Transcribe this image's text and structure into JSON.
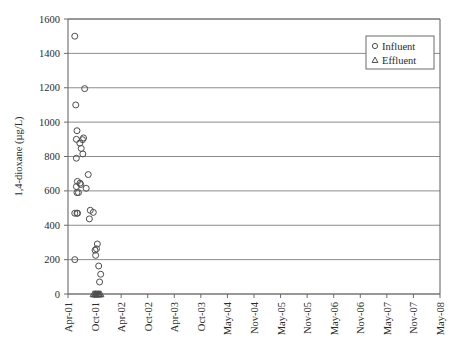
{
  "chart_data": {
    "type": "scatter",
    "title": "",
    "xlabel": "",
    "ylabel": "1,4-dioxane (µg/L)",
    "ylim": [
      0,
      1600
    ],
    "y_ticks": [
      0,
      200,
      400,
      600,
      800,
      1000,
      1200,
      1400,
      1600
    ],
    "y_tick_labels": [
      "0",
      "200",
      "400",
      "600",
      "800",
      "1000",
      "1200",
      "1400",
      "1600"
    ],
    "x_tick_labels": [
      "Apr-01",
      "Oct-01",
      "Apr-02",
      "Oct-02",
      "Apr-03",
      "Oct-03",
      "May-04",
      "Nov-04",
      "May-05",
      "Nov-05",
      "May-06",
      "Nov-06",
      "May-07",
      "Nov-07",
      "May-08"
    ],
    "grid": "horizontal",
    "legend_position": "top-right",
    "legend": [
      {
        "name": "Influent",
        "marker": "circle"
      },
      {
        "name": "Effluent",
        "marker": "triangle"
      }
    ],
    "series": [
      {
        "name": "Influent",
        "marker": "circle",
        "points": [
          {
            "x": "Jul-01",
            "xf": 0.255,
            "y": 1500
          },
          {
            "x": "Jul-01",
            "xf": 0.255,
            "y": 470
          },
          {
            "x": "Jul-01",
            "xf": 0.255,
            "y": 200
          },
          {
            "x": "Aug-01",
            "xf": 0.292,
            "y": 1100
          },
          {
            "x": "Sep-01",
            "xf": 0.315,
            "y": 900
          },
          {
            "x": "Sep-01",
            "xf": 0.315,
            "y": 790
          },
          {
            "x": "Sep-01",
            "xf": 0.315,
            "y": 625
          },
          {
            "x": "Oct-01",
            "xf": 0.338,
            "y": 950
          },
          {
            "x": "Oct-01",
            "xf": 0.338,
            "y": 590
          },
          {
            "x": "Oct-01",
            "xf": 0.338,
            "y": 470
          },
          {
            "x": "Nov-01",
            "xf": 0.355,
            "y": 655
          },
          {
            "x": "Nov-01",
            "xf": 0.359,
            "y": 470
          },
          {
            "x": "Jan-02",
            "xf": 0.395,
            "y": 590
          },
          {
            "x": "Apr-02",
            "xf": 0.445,
            "y": 878
          },
          {
            "x": "Apr-02",
            "xf": 0.452,
            "y": 645
          },
          {
            "x": "Jun-02",
            "xf": 0.478,
            "y": 637
          },
          {
            "x": "Aug-02",
            "xf": 0.497,
            "y": 847
          },
          {
            "x": "Nov-02",
            "xf": 0.545,
            "y": 898
          },
          {
            "x": "Dec-02",
            "xf": 0.558,
            "y": 815
          },
          {
            "x": "Feb-03",
            "xf": 0.585,
            "y": 908
          },
          {
            "x": "May-03",
            "xf": 0.628,
            "y": 1195
          },
          {
            "x": "Oct-03",
            "xf": 0.685,
            "y": 615
          },
          {
            "x": "Apr-04",
            "xf": 0.762,
            "y": 695
          },
          {
            "x": "Aug-04",
            "xf": 0.805,
            "y": 437
          },
          {
            "x": "Oct-04",
            "xf": 0.838,
            "y": 487
          },
          {
            "x": "Oct-05",
            "xf": 0.952,
            "y": 475
          },
          {
            "x": "Mar-06",
            "xf": 1.018,
            "y": 255
          },
          {
            "x": "May-06",
            "xf": 1.04,
            "y": 225
          },
          {
            "x": "Aug-06",
            "xf": 1.072,
            "y": 263
          },
          {
            "x": "Oct-06",
            "xf": 1.105,
            "y": 291
          },
          {
            "x": "Mar-07",
            "xf": 1.155,
            "y": 163
          },
          {
            "x": "May-07",
            "xf": 1.188,
            "y": 70
          },
          {
            "x": "Sep-07",
            "xf": 1.23,
            "y": 115
          }
        ]
      },
      {
        "name": "Effluent",
        "marker": "triangle",
        "points": [
          {
            "x": "Nov-05",
            "xf": 0.952,
            "y": 0
          },
          {
            "x": "Feb-06",
            "xf": 1.0,
            "y": 0
          },
          {
            "x": "Apr-06",
            "xf": 1.032,
            "y": 0
          },
          {
            "x": "May-06",
            "xf": 1.042,
            "y": 0
          },
          {
            "x": "Jul-06",
            "xf": 1.068,
            "y": 0
          },
          {
            "x": "Oct-06",
            "xf": 1.105,
            "y": 0
          },
          {
            "x": "Jan-07",
            "xf": 1.142,
            "y": 0
          },
          {
            "x": "Mar-07",
            "xf": 1.158,
            "y": 0
          },
          {
            "x": "May-07",
            "xf": 1.188,
            "y": 0
          },
          {
            "x": "Sep-07",
            "xf": 1.232,
            "y": 0
          }
        ]
      }
    ]
  }
}
